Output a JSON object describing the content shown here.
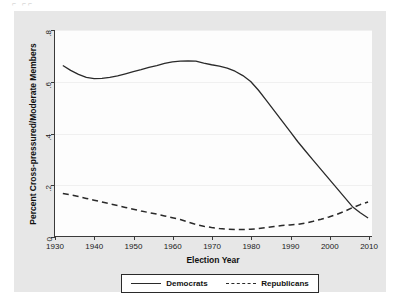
{
  "figure": {
    "top_artifact_text": "⌐  ⌐⌐"
  },
  "chart_data": {
    "type": "line",
    "title": "",
    "xlabel": "Election Year",
    "ylabel": "Percent Cross-pressured/Moderate Members",
    "xlim": [
      1930,
      2011
    ],
    "ylim": [
      0,
      0.8
    ],
    "xticks": [
      1930,
      1940,
      1950,
      1960,
      1970,
      1980,
      1990,
      2000,
      2010
    ],
    "xtick_labels": [
      "1930",
      "1940",
      "1950",
      "1960",
      "1970",
      "1980",
      "1990",
      "2000",
      "2010"
    ],
    "yticks": [
      0,
      0.2,
      0.4,
      0.6,
      0.8
    ],
    "ytick_labels": [
      "0",
      ".2",
      ".4",
      ".6",
      ".8"
    ],
    "grid": true,
    "legend_position": "bottom",
    "x": [
      1932,
      1934,
      1936,
      1938,
      1940,
      1942,
      1944,
      1946,
      1948,
      1950,
      1952,
      1954,
      1956,
      1958,
      1960,
      1962,
      1964,
      1966,
      1968,
      1970,
      1972,
      1974,
      1976,
      1978,
      1980,
      1982,
      1984,
      1986,
      1988,
      1990,
      1992,
      1994,
      1996,
      1998,
      2000,
      2002,
      2004,
      2006,
      2008,
      2010
    ],
    "series": [
      {
        "name": "Democrats",
        "style": "solid",
        "color": "#2a2a2a",
        "values": [
          0.662,
          0.643,
          0.628,
          0.616,
          0.611,
          0.612,
          0.616,
          0.622,
          0.63,
          0.638,
          0.646,
          0.655,
          0.662,
          0.67,
          0.676,
          0.679,
          0.68,
          0.679,
          0.671,
          0.665,
          0.66,
          0.652,
          0.64,
          0.623,
          0.6,
          0.566,
          0.527,
          0.487,
          0.447,
          0.407,
          0.367,
          0.33,
          0.294,
          0.258,
          0.222,
          0.186,
          0.15,
          0.114,
          0.09,
          0.07
        ]
      },
      {
        "name": "Republicans",
        "style": "dashed",
        "color": "#2a2a2a",
        "values": [
          0.165,
          0.16,
          0.153,
          0.146,
          0.139,
          0.132,
          0.125,
          0.118,
          0.111,
          0.104,
          0.097,
          0.091,
          0.085,
          0.078,
          0.071,
          0.064,
          0.054,
          0.045,
          0.038,
          0.033,
          0.029,
          0.026,
          0.025,
          0.025,
          0.026,
          0.029,
          0.033,
          0.037,
          0.041,
          0.043,
          0.045,
          0.05,
          0.057,
          0.065,
          0.074,
          0.084,
          0.096,
          0.11,
          0.122,
          0.132
        ]
      }
    ]
  },
  "legend": {
    "entries": [
      {
        "label": "Democrats",
        "style": "solid"
      },
      {
        "label": "Republicans",
        "style": "dashed"
      }
    ]
  }
}
